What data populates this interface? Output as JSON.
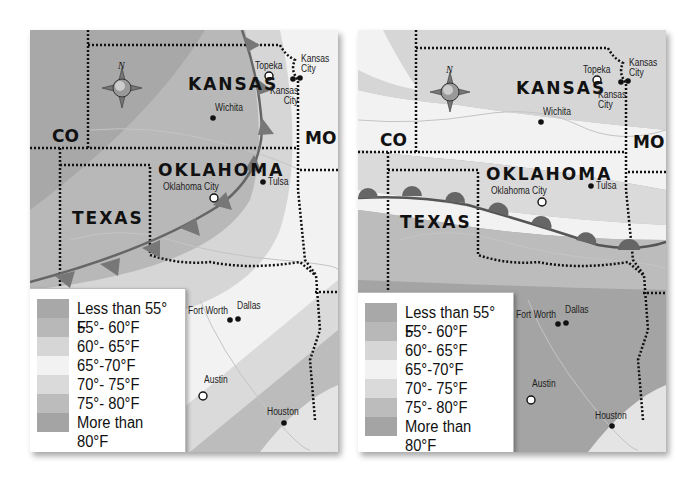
{
  "maps": [
    {
      "id": "left",
      "front_type": "cold-front",
      "states": {
        "kansas": "KANSAS",
        "oklahoma": "OKLAHOMA",
        "texas": "TEXAS",
        "co": "CO",
        "mo": "MO"
      },
      "cities": {
        "topeka": "Topeka",
        "kansas_city_mo": "Kansas\nCity",
        "kansas_city_ks": "Kansas\nCity",
        "wichita": "Wichita",
        "oklahoma_city": "Oklahoma City",
        "tulsa": "Tulsa",
        "fort_worth": "Fort Worth",
        "dallas": "Dallas",
        "austin": "Austin",
        "houston": "Houston"
      },
      "compass": {
        "n": "N",
        "s": "S",
        "e": "E",
        "w": "W"
      }
    },
    {
      "id": "right",
      "front_type": "warm-front",
      "states": {
        "kansas": "KANSAS",
        "oklahoma": "OKLAHOMA",
        "texas": "TEXAS",
        "co": "CO",
        "mo": "MO"
      },
      "cities": {
        "topeka": "Topeka",
        "kansas_city_mo": "Kansas\nCity",
        "kansas_city_ks": "Kansas\nCity",
        "wichita": "Wichita",
        "oklahoma_city": "Oklahoma City",
        "tulsa": "Tulsa",
        "fort_worth": "Fort Worth",
        "dallas": "Dallas",
        "austin": "Austin",
        "houston": "Houston"
      },
      "compass": {
        "n": "N",
        "s": "S",
        "e": "E",
        "w": "W"
      }
    }
  ],
  "legend": [
    {
      "label": "Less than 55° F",
      "color": "#a8a8a8"
    },
    {
      "label": "55°- 60°F",
      "color": "#b8b8b8"
    },
    {
      "label": "60°- 65°F",
      "color": "#d6d6d6"
    },
    {
      "label": "65°-70°F",
      "color": "#f2f2f2"
    },
    {
      "label": "70°- 75°F",
      "color": "#dadada"
    },
    {
      "label": "75°- 80°F",
      "color": "#bcbcbc"
    },
    {
      "label": "More than 80°F",
      "color": "#a4a4a4"
    }
  ]
}
